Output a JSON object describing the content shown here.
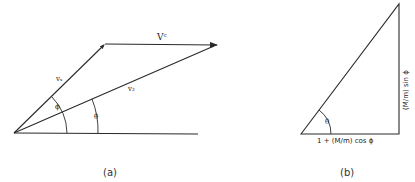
{
  "figure_a": {
    "caption": "(a)",
    "labels": {
      "vs": "vₛ",
      "vc": "Vᶜ",
      "v2": "v₂",
      "phi": "ϕ",
      "theta": "θ"
    }
  },
  "figure_b": {
    "caption": "(b)",
    "labels": {
      "base": "1 + (M/m) cos ϕ",
      "side": "(M/m) sin ϕ",
      "theta": "θ"
    }
  },
  "colors": {
    "line": "#2a2a2a",
    "background": "#ffffff"
  }
}
